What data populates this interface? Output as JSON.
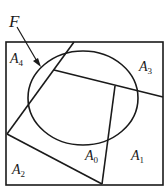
{
  "diagram": {
    "colors": {
      "stroke": "#1a1a1a",
      "background": "#ffffff"
    },
    "labels": {
      "F": {
        "base": "F",
        "sub": ""
      },
      "A4": {
        "base": "A",
        "sub": "4"
      },
      "A3": {
        "base": "A",
        "sub": "3"
      },
      "A2": {
        "base": "A",
        "sub": "2"
      },
      "A1": {
        "base": "A",
        "sub": "1"
      },
      "A0": {
        "base": "A",
        "sub": "0"
      }
    }
  }
}
